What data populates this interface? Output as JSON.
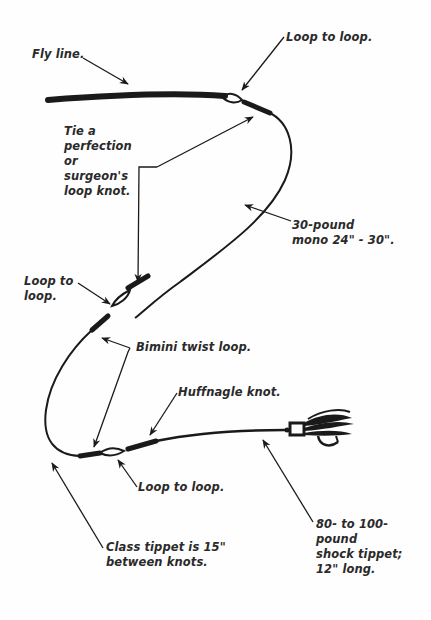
{
  "diagram": {
    "type": "fly-fishing leader rigging diagram",
    "colors": {
      "ink": "#1a1a1a",
      "text": "#2a2a2a",
      "background": "#fefefe"
    },
    "labels": {
      "fly_line": "Fly line.",
      "loop_to_loop_top": "Loop to loop.",
      "tie_perfection": "Tie a\nperfection\nor\nsurgeon's\nloop knot.",
      "mono": "30-pound\nmono 24\" - 30\".",
      "loop_to_loop_left": "Loop to\nloop.",
      "bimini": "Bimini twist loop.",
      "huffnagle": "Huffnagle knot.",
      "loop_to_loop_bottom": "Loop to loop.",
      "class_tippet": "Class tippet is 15\"\nbetween knots.",
      "shock_tippet": "80- to 100-\npound\nshock tippet;\n12\" long."
    },
    "components": [
      "fly-line",
      "loop-to-loop connection (fly line to butt)",
      "30-pound mono butt section",
      "perfection / surgeon's loop knot",
      "loop-to-loop connection (butt to class tippet)",
      "bimini twist loop (x2)",
      "class tippet",
      "huffnagle knot",
      "shock tippet",
      "streamer fly"
    ]
  }
}
